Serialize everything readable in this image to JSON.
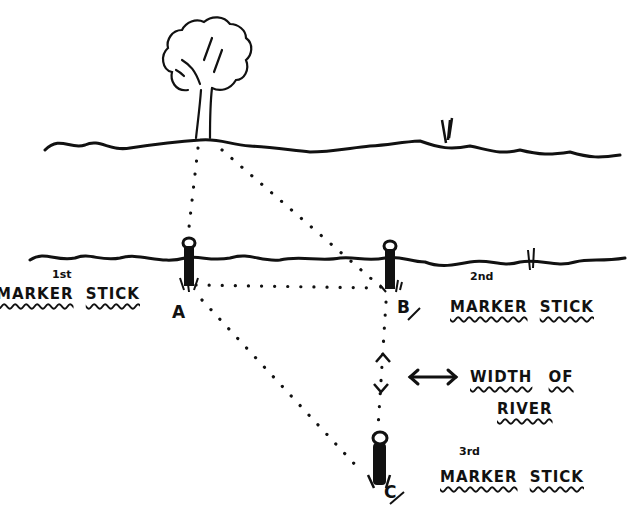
{
  "diagram": {
    "colors": {
      "ink": "#111111",
      "background": "#ffffff"
    },
    "landmark": {
      "icon": "tree-icon"
    },
    "points": {
      "a": {
        "letter": "A"
      },
      "b": {
        "letter": "B"
      },
      "c": {
        "letter": "C"
      }
    },
    "labels": {
      "marker1": {
        "ordinal": "1st",
        "word1": "MARKER",
        "word2": "STICK"
      },
      "marker2": {
        "ordinal": "2nd",
        "word1": "MARKER",
        "word2": "STICK"
      },
      "marker3": {
        "ordinal": "3rd",
        "word1": "MARKER",
        "word2": "STICK"
      },
      "width": {
        "line1_word1": "WIDTH",
        "line1_word2": "OF",
        "line2": "RIVER"
      }
    }
  }
}
